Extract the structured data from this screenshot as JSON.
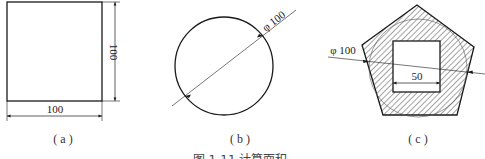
{
  "figure": {
    "caption": "图 1-11  计算面积",
    "caption_note": "caption partially clipped at bottom edge",
    "panels": [
      {
        "id": "a",
        "label": "( a )",
        "shape": "square",
        "dims": {
          "width": "100",
          "height": "100"
        }
      },
      {
        "id": "b",
        "label": "( b )",
        "shape": "circle",
        "dims": {
          "diameter": "φ 100"
        }
      },
      {
        "id": "c",
        "label": "( c )",
        "shape": "pentagon-with-square-hole",
        "dims": {
          "circle_diameter": "φ 100",
          "square_side": "50"
        },
        "hatch": true
      }
    ]
  },
  "colors": {
    "line": "#1a1a1a",
    "hatch": "#333333",
    "background": "#ffffff"
  }
}
